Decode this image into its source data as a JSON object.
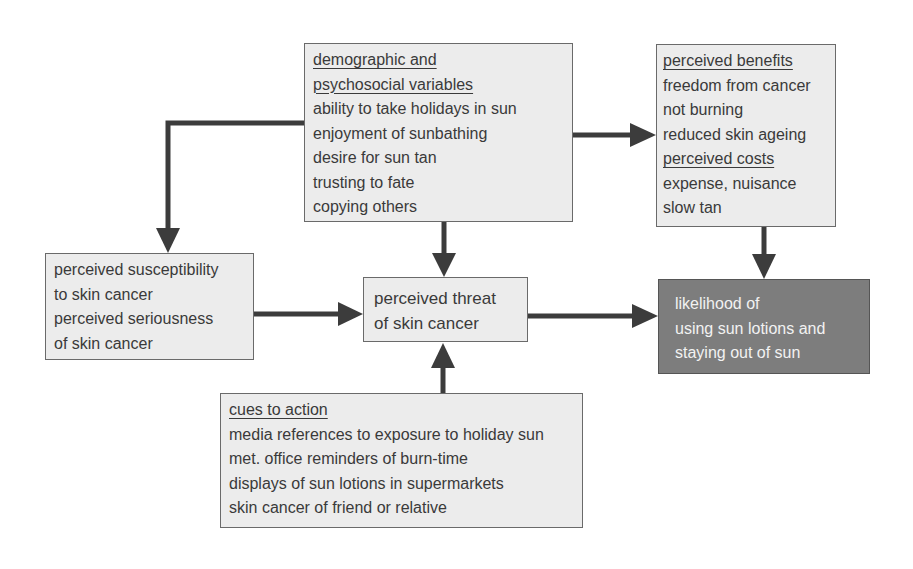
{
  "diagram": {
    "nodes": {
      "demographic": {
        "heading_lines": [
          "demographic and",
          "psychosocial variables"
        ],
        "items": [
          "ability to take holidays in sun",
          "enjoyment of sunbathing",
          "desire for sun tan",
          "trusting to fate",
          "copying others"
        ]
      },
      "benefits_costs": {
        "benefits_heading": "perceived benefits",
        "benefits": [
          "freedom from cancer",
          "not burning",
          "reduced skin ageing"
        ],
        "costs_heading": "perceived costs",
        "costs": [
          "expense, nuisance",
          "slow tan"
        ]
      },
      "susceptibility": {
        "lines": [
          "perceived susceptibility",
          "to skin cancer",
          "perceived seriousness",
          "of skin cancer"
        ]
      },
      "threat": {
        "lines": [
          "perceived threat",
          "of skin cancer"
        ]
      },
      "likelihood": {
        "lines": [
          "likelihood of",
          "using sun lotions and",
          "staying out of sun"
        ]
      },
      "cues": {
        "heading": "cues to action",
        "items": [
          "media references to exposure to holiday sun",
          "met. office reminders of burn-time",
          "displays of sun lotions in supermarkets",
          "skin cancer of friend or relative"
        ]
      }
    },
    "edges": [
      {
        "from": "demographic",
        "to": "susceptibility"
      },
      {
        "from": "demographic",
        "to": "threat"
      },
      {
        "from": "demographic",
        "to": "benefits_costs"
      },
      {
        "from": "susceptibility",
        "to": "threat"
      },
      {
        "from": "cues",
        "to": "threat"
      },
      {
        "from": "threat",
        "to": "likelihood"
      },
      {
        "from": "benefits_costs",
        "to": "likelihood"
      }
    ],
    "colors": {
      "box_fill": "#ececec",
      "box_border": "#6a6a6a",
      "outcome_fill": "#7d7d7d",
      "arrow": "#3c3c3c",
      "text": "#3a3a3a"
    }
  }
}
